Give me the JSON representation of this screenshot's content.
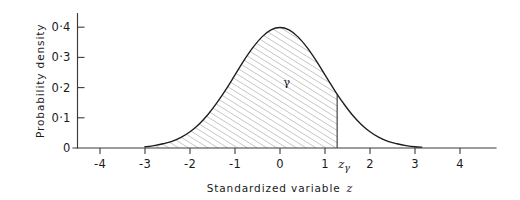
{
  "figure": {
    "name": "standard-normal-distribution-with-shaded-tail-area",
    "style": "hand-drawn line chart, hatched area fill, no gridlines"
  },
  "axes": {
    "x": {
      "title": "Standardized variable",
      "title_variable": "z",
      "tick_labels": [
        "-4",
        "-3",
        "-2",
        "-1",
        "0",
        "1",
        "2",
        "3",
        "4"
      ],
      "tick_values": [
        -4,
        -3,
        -2,
        -1,
        0,
        1,
        2,
        3,
        4
      ],
      "range": [
        -4.6,
        4.8
      ]
    },
    "y": {
      "title": "Probability density",
      "tick_labels": [
        "0",
        "0·1",
        "0·2",
        "0·3",
        "0·4"
      ],
      "tick_values": [
        0,
        0.1,
        0.2,
        0.3,
        0.4
      ],
      "range": [
        0,
        0.45
      ]
    }
  },
  "annotations": {
    "area_label": "γ",
    "cutoff_label_base": "z",
    "cutoff_label_sub": "γ",
    "cutoff_value": 1.27
  },
  "colors": {
    "background": "#ffffff",
    "axis": "#3b3b3b",
    "curve": "#1c1c1c",
    "hatch": "#8d8d8d",
    "text": "#1a1a1a"
  },
  "chart_data": {
    "type": "line",
    "title": "",
    "xlabel": "Standardized variable z",
    "ylabel": "Probability density",
    "xlim": [
      -4.6,
      4.8
    ],
    "ylim": [
      0,
      0.45
    ],
    "grid": false,
    "legend": null,
    "distribution": "standard normal (Gaussian), mean 0, standard deviation 1",
    "x": [
      -3.0,
      -2.8,
      -2.6,
      -2.4,
      -2.2,
      -2.0,
      -1.8,
      -1.6,
      -1.4,
      -1.2,
      -1.0,
      -0.8,
      -0.6,
      -0.4,
      -0.2,
      0.0,
      0.2,
      0.4,
      0.6,
      0.8,
      1.0,
      1.2,
      1.27,
      1.4,
      1.6,
      1.8,
      2.0,
      2.2,
      2.4,
      2.6,
      2.8,
      3.0,
      3.15
    ],
    "y": [
      0.004,
      0.008,
      0.014,
      0.022,
      0.035,
      0.054,
      0.079,
      0.111,
      0.15,
      0.194,
      0.242,
      0.29,
      0.333,
      0.368,
      0.391,
      0.399,
      0.391,
      0.368,
      0.333,
      0.29,
      0.242,
      0.194,
      0.178,
      0.15,
      0.111,
      0.079,
      0.054,
      0.035,
      0.022,
      0.014,
      0.008,
      0.004,
      0.003
    ],
    "shaded_region": {
      "label": "γ",
      "from": "-infinity",
      "to": 1.27,
      "fill": "diagonal hatching",
      "meaning": "cumulative probability γ below zγ"
    },
    "markers": [
      {
        "name": "cutoff",
        "x": 1.27,
        "label": "zγ",
        "vertical_line_to_curve": true,
        "y_at_curve": 0.178
      }
    ]
  }
}
